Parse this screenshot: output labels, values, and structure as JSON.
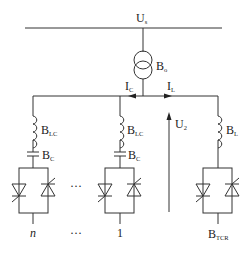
{
  "diagram": {
    "type": "circuit-schematic",
    "labels": {
      "source_voltage": {
        "main": "U",
        "sub": "s"
      },
      "transformer": {
        "main": "B",
        "sub": "o"
      },
      "current_cap": {
        "main": "I",
        "sub": "C"
      },
      "current_ind": {
        "main": "I",
        "sub": "L"
      },
      "secondary_voltage": {
        "main": "U",
        "sub": "2"
      },
      "branch_inductor": {
        "main": "B",
        "sub": "LC"
      },
      "branch_capacitor": {
        "main": "B",
        "sub": "C"
      },
      "tcr_inductor": {
        "main": "B",
        "sub": "L"
      },
      "tcr": {
        "main": "B",
        "sub": "TCR"
      }
    },
    "branches": [
      {
        "id": "n",
        "label": "n",
        "italic": true
      },
      {
        "id": "ellipsis",
        "label": "···"
      },
      {
        "id": "1",
        "label": "1"
      },
      {
        "id": "tcr",
        "label": "B_TCR"
      }
    ],
    "ellipsis": "···",
    "colors": {
      "line": "#333333",
      "background": "#ffffff"
    }
  }
}
